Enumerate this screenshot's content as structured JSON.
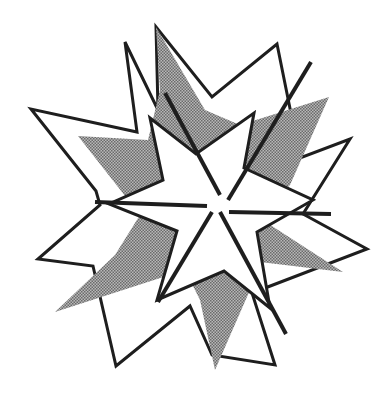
{
  "figure": {
    "colors": {
      "background": "#ffffff",
      "stroke": "#1e1e1e",
      "halftone_fill": "#9a9a9a",
      "star_fill": "#ffffff"
    },
    "stroke_width": 3,
    "outer_star_points": "125,42 137,132 31,109 96,191 100,205 38,259 93,266 116,366 190,306 212,355 275,365 252,293 367,249 303,214 350,139 300,158 277,44 212,97 156,27 158,110",
    "gray_star_points": "156,27 205,110 240,125 329,97 290,185 258,217 343,272 260,262 250,290 215,370 200,300 185,270 55,312 115,255 140,215 78,136 148,140 160,90",
    "inner_star_points": "150,118 196,154 254,113 244,168 313,200 257,232 270,308 224,271 157,300 177,231 109,204 163,180",
    "lines": [
      {
        "x1": 95,
        "y1": 202,
        "x2": 207,
        "y2": 206
      },
      {
        "x1": 229,
        "y1": 212,
        "x2": 331,
        "y2": 214
      },
      {
        "x1": 165,
        "y1": 93,
        "x2": 220,
        "y2": 195
      },
      {
        "x1": 311,
        "y1": 62,
        "x2": 228,
        "y2": 200
      },
      {
        "x1": 212,
        "y1": 212,
        "x2": 158,
        "y2": 302
      },
      {
        "x1": 220,
        "y1": 212,
        "x2": 286,
        "y2": 334
      }
    ]
  }
}
